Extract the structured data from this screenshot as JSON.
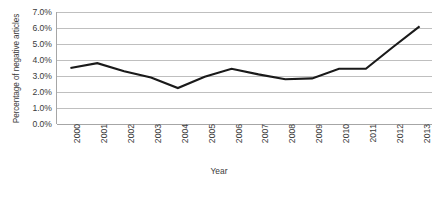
{
  "chart_data": {
    "type": "line",
    "title": "",
    "subtitle": "",
    "xlabel": "Year",
    "ylabel": "Percentage of negative articles",
    "categories": [
      "2000",
      "2001",
      "2002",
      "2003",
      "2004",
      "2005",
      "2006",
      "2007",
      "2008",
      "2009",
      "2010",
      "2011",
      "2012",
      "2013"
    ],
    "x": [
      2000,
      2001,
      2002,
      2003,
      2004,
      2005,
      2006,
      2007,
      2008,
      2009,
      2010,
      2011,
      2012,
      2013
    ],
    "values": [
      3.5,
      3.8,
      3.3,
      2.9,
      2.25,
      2.95,
      3.45,
      3.1,
      2.8,
      2.85,
      3.45,
      3.45,
      4.8,
      6.1
    ],
    "series": [
      {
        "name": "Percentage of negative articles",
        "values": [
          3.5,
          3.8,
          3.3,
          2.9,
          2.25,
          2.95,
          3.45,
          3.1,
          2.8,
          2.85,
          3.45,
          3.45,
          4.8,
          6.1
        ]
      }
    ],
    "ylim": [
      0.0,
      7.0
    ],
    "ytick_values": [
      0.0,
      1.0,
      2.0,
      3.0,
      4.0,
      5.0,
      6.0,
      7.0
    ],
    "ytick_labels": [
      "0.0%",
      "1.0%",
      "2.0%",
      "3.0%",
      "4.0%",
      "5.0%",
      "6.0%",
      "7.0%"
    ],
    "yunit": "%",
    "grid": true,
    "grid_axis": "y",
    "legend": false,
    "legend_position": "none",
    "line_color": "#1a1a1a",
    "grid_color": "#bfbfbf",
    "axis_color": "#a6a6a6",
    "background_color": "#ffffff",
    "markers": false,
    "xtick_rotation": -90
  }
}
